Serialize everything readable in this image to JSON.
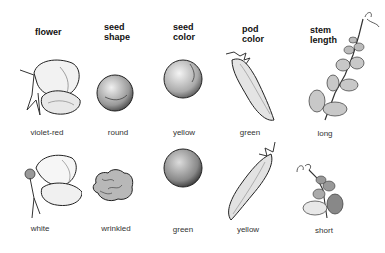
{
  "headers": [
    {
      "line1": "flower",
      "line2": ""
    },
    {
      "line1": "seed",
      "line2": "shape"
    },
    {
      "line1": "seed",
      "line2": "color"
    },
    {
      "line1": "pod",
      "line2": "color"
    },
    {
      "line1": "stem",
      "line2": "length"
    }
  ],
  "rows": [
    {
      "labels": [
        "violet-red",
        "round",
        "yellow",
        "green",
        "long"
      ]
    },
    {
      "labels": [
        "white",
        "wrinkled",
        "green",
        "yellow",
        "short"
      ]
    }
  ],
  "illustrations": [
    [
      "flower-violet-red",
      "seed-round",
      "seed-yellow",
      "pod-green",
      "stem-long"
    ],
    [
      "flower-white",
      "seed-wrinkled",
      "seed-green",
      "pod-yellow",
      "stem-short"
    ]
  ]
}
